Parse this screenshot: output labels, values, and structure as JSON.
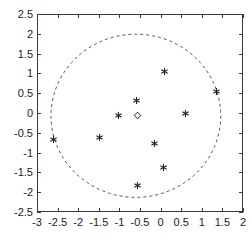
{
  "chart_data": {
    "type": "scatter",
    "title": "",
    "xlabel": "",
    "ylabel": "",
    "xlim": [
      -3,
      2
    ],
    "ylim": [
      -2.5,
      2.5
    ],
    "grid": false,
    "legend": "none",
    "xticks": [
      -3,
      -2.5,
      -2,
      -1.5,
      -1,
      -0.5,
      0,
      0.5,
      1,
      1.5,
      2
    ],
    "xticklabels": [
      "-3",
      "-2.5",
      "-2",
      "-1.5",
      "-1",
      "-0.5",
      "0",
      "0.5",
      "1",
      "1.5",
      "2"
    ],
    "yticks": [
      -2.5,
      -2,
      -1.5,
      -1,
      -0.5,
      0,
      0.5,
      1,
      1.5,
      2,
      2.5
    ],
    "yticklabels": [
      "-2.5",
      "-2",
      "-1.5",
      "-1",
      "-0.5",
      "0",
      "0.5",
      "1",
      "1.5",
      "2",
      "2.5"
    ],
    "series": [
      {
        "name": "data-points",
        "marker": "asterisk",
        "color": "#222222",
        "points": [
          {
            "x": 0.1,
            "y": 1.05
          },
          {
            "x": 1.35,
            "y": 0.55
          },
          {
            "x": -0.58,
            "y": 0.32
          },
          {
            "x": 0.6,
            "y": 0.0
          },
          {
            "x": -1.01,
            "y": -0.07
          },
          {
            "x": -1.49,
            "y": -0.62
          },
          {
            "x": -2.59,
            "y": -0.68
          },
          {
            "x": -0.15,
            "y": -0.77
          },
          {
            "x": 0.06,
            "y": -1.37
          },
          {
            "x": -0.56,
            "y": -1.82
          }
        ]
      },
      {
        "name": "centroid",
        "marker": "diamond",
        "color": "#222222",
        "points": [
          {
            "x": -0.56,
            "y": -0.07
          }
        ]
      }
    ],
    "annotations": [
      {
        "name": "dashed-circle",
        "shape": "circle",
        "style": "dashed",
        "color": "#555555",
        "center": {
          "x": -0.6,
          "y": -0.07
        },
        "radius": 2.06
      }
    ]
  },
  "axes": {
    "frame_color": "#3a3a3a",
    "tick_color": "#3a3a3a",
    "label_color": "#1a1a1a"
  }
}
